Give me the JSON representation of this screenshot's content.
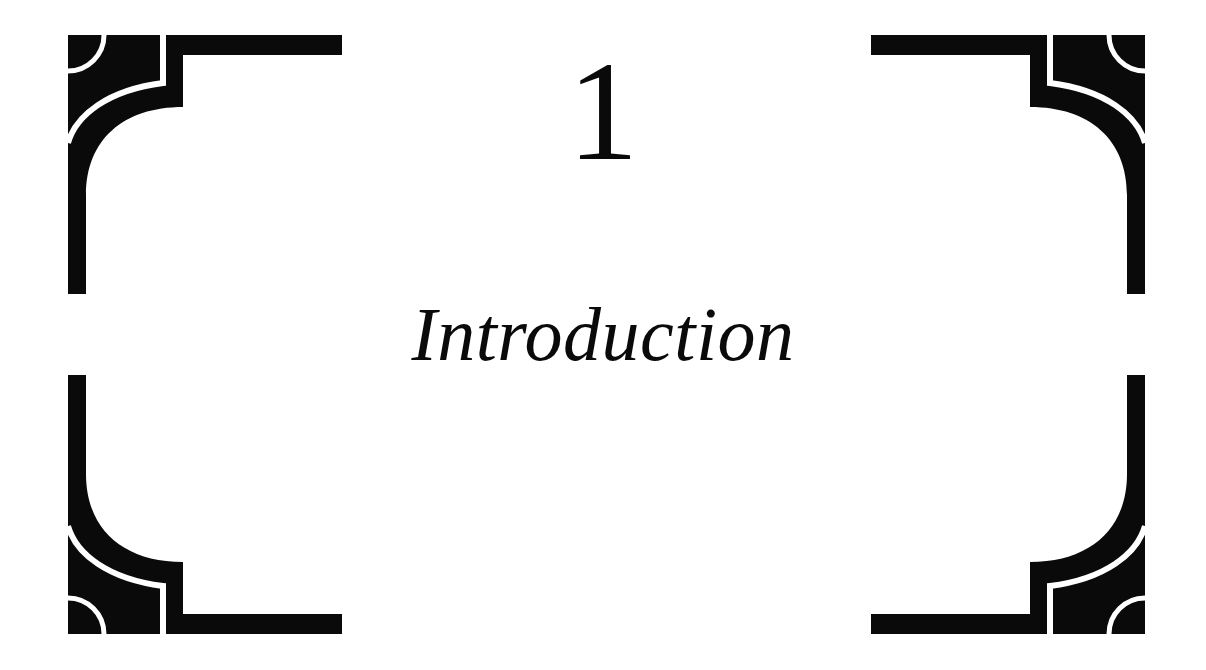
{
  "page": {
    "chapter_number": "1",
    "chapter_title": "Introduction",
    "colors": {
      "ink": "#0a0a0a",
      "paper": "#ffffff"
    }
  },
  "ornaments": {
    "style": "art-deco-corner-bracket",
    "corners": [
      {
        "position": "top-left",
        "icon": "corner-ornament-icon"
      },
      {
        "position": "top-right",
        "icon": "corner-ornament-icon"
      },
      {
        "position": "bottom-left",
        "icon": "corner-ornament-icon"
      },
      {
        "position": "bottom-right",
        "icon": "corner-ornament-icon"
      }
    ]
  }
}
